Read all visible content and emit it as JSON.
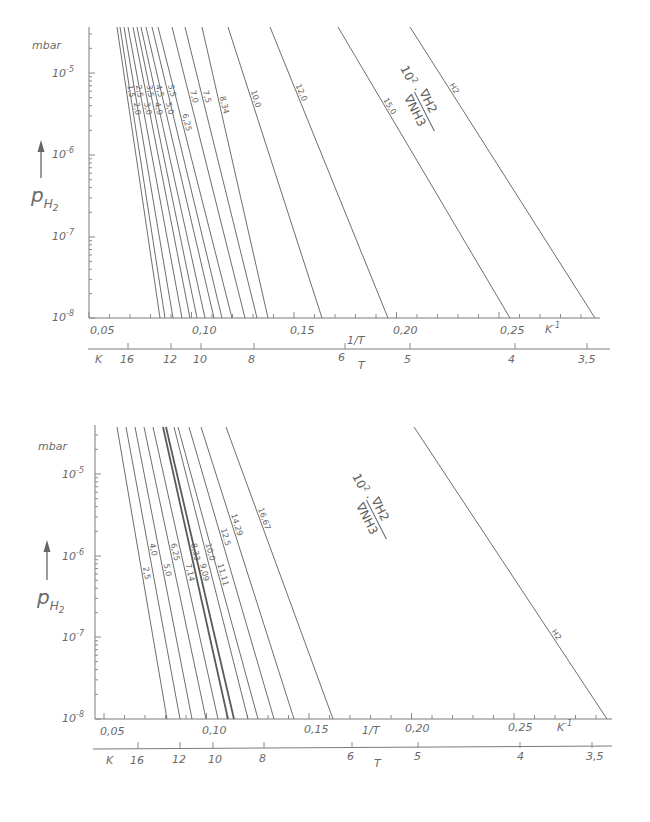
{
  "chart_data": [
    {
      "type": "line",
      "title": "",
      "ylabel": "p_H2",
      "yunit": "mbar",
      "y_scale": "log",
      "ylim": [
        1e-08,
        3e-05
      ],
      "ytick_labels": [
        "10^-5",
        "10^-6",
        "10^-7",
        "10^-8"
      ],
      "xlabel": "1/T",
      "xunit": "K^-1",
      "xlim": [
        0.05,
        0.29
      ],
      "xtick_labels": [
        "0,05",
        "0,10",
        "0,15",
        "0,20",
        "0,25"
      ],
      "secondary_x": {
        "label": "T",
        "unit": "K",
        "tick_labels": [
          "16",
          "12",
          "10",
          "8",
          "6",
          "5",
          "4",
          "3,5"
        ]
      },
      "parameter_label": "10^2 · ∇H2 / ∇NH3",
      "series": [
        {
          "name": "1,5",
          "x_at_1e-8": 0.081
        },
        {
          "name": "2,0",
          "x_at_1e-8": 0.083
        },
        {
          "name": "2,5",
          "x_at_1e-8": 0.086
        },
        {
          "name": "3,0",
          "x_at_1e-8": 0.089
        },
        {
          "name": "3,5",
          "x_at_1e-8": 0.092
        },
        {
          "name": "4,0",
          "x_at_1e-8": 0.094
        },
        {
          "name": "4,5",
          "x_at_1e-8": 0.097
        },
        {
          "name": "5,0",
          "x_at_1e-8": 0.1
        },
        {
          "name": "5,5",
          "x_at_1e-8": 0.103
        },
        {
          "name": "6,25",
          "x_at_1e-8": 0.106
        },
        {
          "name": "7,0",
          "x_at_1e-8": 0.111
        },
        {
          "name": "7,5",
          "x_at_1e-8": 0.115
        },
        {
          "name": "8,34",
          "x_at_1e-8": 0.119
        },
        {
          "name": "10,0",
          "x_at_1e-8": 0.134
        },
        {
          "name": "12,0",
          "x_at_1e-8": 0.157
        },
        {
          "name": "15,0",
          "x_at_1e-8": 0.198
        },
        {
          "name": "H2",
          "x_at_1e-8": 0.286
        }
      ]
    },
    {
      "type": "line",
      "title": "",
      "ylabel": "p_H2",
      "yunit": "mbar",
      "y_scale": "log",
      "ylim": [
        1e-08,
        3e-05
      ],
      "ytick_labels": [
        "10^-5",
        "10^-6",
        "10^-7",
        "10^-8"
      ],
      "xlabel": "1/T",
      "xunit": "K^-1",
      "xlim": [
        0.05,
        0.29
      ],
      "xtick_labels": [
        "0,05",
        "0,10",
        "0,15",
        "0,20",
        "0,25"
      ],
      "secondary_x": {
        "label": "T",
        "unit": "K",
        "tick_labels": [
          "16",
          "12",
          "10",
          "8",
          "6",
          "5",
          "4",
          "3,5"
        ]
      },
      "parameter_label": "10^2 · ∇H2 / ∇NH3",
      "series": [
        {
          "name": "2,5",
          "x_at_1e-8": 0.082
        },
        {
          "name": "4,0",
          "x_at_1e-8": 0.086
        },
        {
          "name": "5,0",
          "x_at_1e-8": 0.09
        },
        {
          "name": "6,25",
          "x_at_1e-8": 0.095
        },
        {
          "name": "7,14",
          "x_at_1e-8": 0.099
        },
        {
          "name": "8,33",
          "x_at_1e-8": 0.104
        },
        {
          "name": "9,09",
          "x_at_1e-8": 0.108
        },
        {
          "name": "10,0",
          "x_at_1e-8": 0.112
        },
        {
          "name": "11,11",
          "x_at_1e-8": 0.117
        },
        {
          "name": "12,5",
          "x_at_1e-8": 0.123
        },
        {
          "name": "14,29",
          "x_at_1e-8": 0.131
        },
        {
          "name": "16,67",
          "x_at_1e-8": 0.149
        },
        {
          "name": "H2",
          "x_at_1e-8": 0.286
        }
      ]
    }
  ],
  "charts": [
    {
      "unit": "mbar",
      "y_ticks": [
        {
          "base": "10",
          "exp": "-5"
        },
        {
          "base": "10",
          "exp": "-6"
        },
        {
          "base": "10",
          "exp": "-7"
        },
        {
          "base": "10",
          "exp": "-8"
        }
      ],
      "x_ticks": [
        "0,05",
        "0,10",
        "0,15",
        "0,20",
        "0,25"
      ],
      "x_unit": "K",
      "x_unit_exp": "-1",
      "x_name": "1/T",
      "t_unit": "K",
      "t_ticks": [
        "16",
        "12",
        "10",
        "8",
        "6",
        "5",
        "4",
        "3,5"
      ],
      "t_name": "T",
      "ylabel": "p",
      "ylabel_sub": "H",
      "ylabel_sub2": "2",
      "param_prefix": "10",
      "param_exp": "2",
      "param_num": "∇H2",
      "param_den": "∇NH3",
      "lines": [
        {
          "label": "1,5",
          "x1": 117,
          "x2": 160
        },
        {
          "label": "2,0",
          "x1": 120,
          "x2": 165
        },
        {
          "label": "2,5",
          "x1": 124,
          "x2": 173
        },
        {
          "label": "3,0",
          "x1": 128,
          "x2": 182
        },
        {
          "label": "3,5",
          "x1": 133,
          "x2": 190
        },
        {
          "label": "4,0",
          "x1": 137,
          "x2": 197
        },
        {
          "label": "4,5",
          "x1": 141,
          "x2": 205
        },
        {
          "label": "5,0",
          "x1": 146,
          "x2": 214
        },
        {
          "label": "5,5",
          "x1": 152,
          "x2": 222
        },
        {
          "label": "6,25",
          "x1": 158,
          "x2": 232
        },
        {
          "label": "7,0",
          "x1": 172,
          "x2": 245
        },
        {
          "label": "7,5",
          "x1": 185,
          "x2": 257
        },
        {
          "label": "8,34",
          "x1": 202,
          "x2": 268
        },
        {
          "label": "10,0",
          "x1": 228,
          "x2": 322
        },
        {
          "label": "12,0",
          "x1": 270,
          "x2": 388
        },
        {
          "label": "15,0",
          "x1": 338,
          "x2": 510
        },
        {
          "label": "H2",
          "x1": 410,
          "x2": 595
        }
      ]
    },
    {
      "unit": "mbar",
      "y_ticks": [
        {
          "base": "10",
          "exp": "-5"
        },
        {
          "base": "10",
          "exp": "-6"
        },
        {
          "base": "10",
          "exp": "-7"
        },
        {
          "base": "10",
          "exp": "-8"
        }
      ],
      "x_ticks": [
        "0,05",
        "0,10",
        "0,15",
        "0,20",
        "0,25"
      ],
      "x_unit": "K",
      "x_unit_exp": "-1",
      "x_name": "1/T",
      "t_unit": "K",
      "t_ticks": [
        "16",
        "12",
        "10",
        "8",
        "6",
        "5",
        "4",
        "3,5"
      ],
      "t_name": "T",
      "ylabel": "p",
      "ylabel_sub": "H",
      "ylabel_sub2": "2",
      "param_prefix": "10",
      "param_exp": "2",
      "param_num": "∇H2",
      "param_den": "∇NH3",
      "lines": [
        {
          "label": "2,5",
          "x1": 117,
          "x2": 167
        },
        {
          "label": "4,0",
          "x1": 126,
          "x2": 180
        },
        {
          "label": "5,0",
          "x1": 135,
          "x2": 192
        },
        {
          "label": "6,25",
          "x1": 144,
          "x2": 206
        },
        {
          "label": "7,14",
          "x1": 153,
          "x2": 218
        },
        {
          "label": "8,33",
          "x1": 163,
          "x2": 228
        },
        {
          "label": "9,09",
          "x1": 166,
          "x2": 234
        },
        {
          "label": "10,0",
          "x1": 174,
          "x2": 248
        },
        {
          "label": "11,11",
          "x1": 178,
          "x2": 258
        },
        {
          "label": "12,5",
          "x1": 189,
          "x2": 274
        },
        {
          "label": "14,29",
          "x1": 201,
          "x2": 294
        },
        {
          "label": "16,67",
          "x1": 226,
          "x2": 333
        },
        {
          "label": "H2",
          "x1": 414,
          "x2": 607
        }
      ]
    }
  ]
}
